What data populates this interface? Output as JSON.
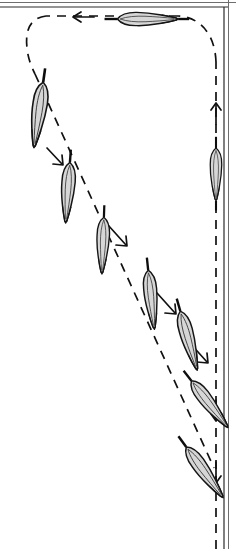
{
  "figure": {
    "title": "Sequence diagram of an elongated dart-shaped body following a looping dashed trajectory",
    "caption": "",
    "background_color": "#ffffff",
    "frame": {
      "name": "page-border",
      "style": "double-rule",
      "outer_color": "#6e6e6e",
      "inner_color": "#2b2b2b",
      "top_rule_y": [
        2,
        7
      ],
      "right_rule_x": [
        224,
        229
      ],
      "left_rule": false,
      "bottom_rule": false
    },
    "trajectory": {
      "name": "motion-path",
      "style": "dashed",
      "stroke_color": "#111111",
      "dash_pattern": "9 7",
      "stroke_width": 1.7,
      "direction_note": "travels up the right edge, across the top to the left, down the left side, then diagonally down-right back toward the right edge",
      "segments": [
        {
          "id": "right-up",
          "from": [
            216,
            520
          ],
          "to": [
            216,
            60
          ],
          "orientation": "vertical"
        },
        {
          "id": "top-left-turn",
          "from": [
            216,
            60
          ],
          "to": [
            176,
            16
          ],
          "orientation": "curve"
        },
        {
          "id": "top-leftward",
          "from": [
            176,
            16
          ],
          "to": [
            44,
            16
          ],
          "orientation": "horizontal"
        },
        {
          "id": "left-down-turn",
          "from": [
            44,
            16
          ],
          "to": [
            36,
            70
          ],
          "orientation": "curve"
        },
        {
          "id": "diagonal-descent",
          "from": [
            36,
            70
          ],
          "to": [
            210,
            470
          ],
          "orientation": "diagonal"
        }
      ]
    },
    "arrows": [
      {
        "name": "arrow-right-edge-up",
        "x": 216,
        "y": 113,
        "direction": "up"
      },
      {
        "name": "arrow-top-leftward",
        "x": 82,
        "y": 17,
        "direction": "left"
      },
      {
        "name": "arrow-diagonal-1",
        "x": 56,
        "y": 157,
        "direction": "down-right"
      },
      {
        "name": "arrow-diagonal-2",
        "x": 118,
        "y": 235,
        "direction": "down-right"
      },
      {
        "name": "arrow-diagonal-3",
        "x": 167,
        "y": 303,
        "direction": "down-right"
      },
      {
        "name": "arrow-diagonal-4",
        "x": 199,
        "y": 352,
        "direction": "down-right"
      },
      {
        "name": "arrow-bottom-down-1",
        "x": 216,
        "y": 410,
        "direction": "down"
      },
      {
        "name": "arrow-bottom-down-2",
        "x": 216,
        "y": 470,
        "direction": "down"
      }
    ],
    "bodies": [
      {
        "id": 1,
        "name": "body-top-horizontal",
        "x": 145,
        "y": 19,
        "rotation": 90,
        "scale": 0.92,
        "pose": "horizontal, nose pointing right",
        "stem": "both"
      },
      {
        "id": 2,
        "name": "body-left-upper",
        "x": 39,
        "y": 112,
        "rotation": 8,
        "scale": 1.0,
        "pose": "near vertical, nose up",
        "stem": "top"
      },
      {
        "id": 3,
        "name": "body-diagonal-1",
        "x": 68,
        "y": 190,
        "rotation": 4,
        "scale": 0.92,
        "pose": "near vertical, nose up",
        "stem": "top"
      },
      {
        "id": 4,
        "name": "body-diagonal-2",
        "x": 103,
        "y": 243,
        "rotation": 2,
        "scale": 0.86,
        "pose": "near vertical, nose up",
        "stem": "top"
      },
      {
        "id": 5,
        "name": "body-diagonal-3",
        "x": 151,
        "y": 297,
        "rotation": -6,
        "scale": 0.9,
        "pose": "tilted, nose up-right",
        "stem": "top"
      },
      {
        "id": 6,
        "name": "body-diagonal-4",
        "x": 188,
        "y": 338,
        "rotation": -16,
        "scale": 0.93,
        "pose": "tilted, nose up-right",
        "stem": "top"
      },
      {
        "id": 7,
        "name": "body-lower-1",
        "x": 208,
        "y": 402,
        "rotation": -38,
        "scale": 0.9,
        "pose": "strongly tilted, nose up-right",
        "stem": "top"
      },
      {
        "id": 8,
        "name": "body-lower-2",
        "x": 203,
        "y": 470,
        "rotation": -36,
        "scale": 0.95,
        "pose": "strongly tilted, nose up-right",
        "stem": "top"
      },
      {
        "id": 9,
        "name": "body-right-vertical",
        "x": 216,
        "y": 172,
        "rotation": 0,
        "scale": 0.8,
        "pose": "vertical on right dashed line, nose up",
        "stem": "both"
      }
    ],
    "body_style": {
      "fill_color": "#d6d6d6",
      "outline_color": "#151515",
      "crease_color": "#3a3a3a",
      "stem_color": "#0d0d0d"
    }
  }
}
